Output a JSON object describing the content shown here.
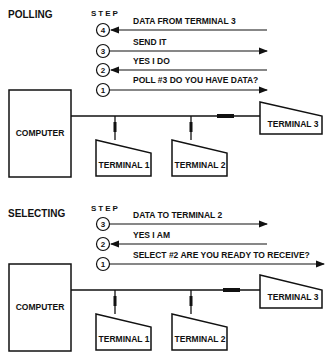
{
  "polling": {
    "title": "POLLING",
    "step_label": "STEP",
    "steps": [
      {
        "num": "4",
        "label": "DATA FROM TERMINAL 3",
        "direction": "to-computer"
      },
      {
        "num": "3",
        "label": "SEND IT",
        "direction": "to-terminal"
      },
      {
        "num": "2",
        "label": "YES I DO",
        "direction": "to-computer"
      },
      {
        "num": "1",
        "label": "POLL #3 DO YOU HAVE DATA?",
        "direction": "to-terminal"
      }
    ],
    "computer": "COMPUTER",
    "terminals": [
      "TERMINAL 1",
      "TERMINAL 2",
      "TERMINAL 3"
    ]
  },
  "selecting": {
    "title": "SELECTING",
    "step_label": "STEP",
    "steps": [
      {
        "num": "3",
        "label": "DATA TO TERMINAL 2",
        "direction": "to-terminal"
      },
      {
        "num": "2",
        "label": "YES I AM",
        "direction": "to-computer"
      },
      {
        "num": "1",
        "label": "SELECT #2 ARE YOU READY TO RECEIVE?",
        "direction": "to-terminal"
      }
    ],
    "computer": "COMPUTER",
    "terminals": [
      "TERMINAL 1",
      "TERMINAL 2",
      "TERMINAL 3"
    ]
  }
}
